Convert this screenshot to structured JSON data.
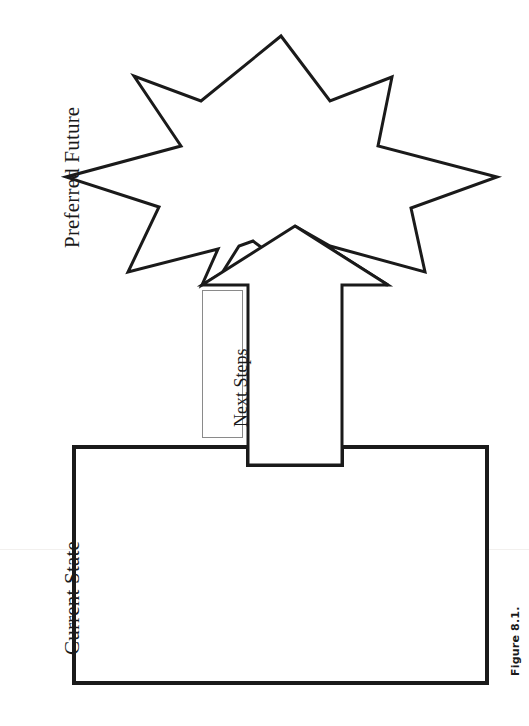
{
  "figure": {
    "caption": "Figure 8.1.",
    "stroke_color": "#1a1a1a",
    "fill_color": "#ffffff",
    "page_background": "#ffffff"
  },
  "labels": {
    "preferred_future": "Preferred Future",
    "current_state": "Current State",
    "next_steps": "Next Steps"
  },
  "shapes": {
    "starburst": {
      "name": "preferred-future-starburst",
      "points": 8,
      "stroke_width": 3,
      "outline_points": "281,36 330,101 392,77 378,146 497,177 411,208 425,272 330,246 295,226 388,285 293,271 253,241 239,246 222,273 202,285 218,249 128,272 159,207 66,177 181,146 134,76 201,101"
    },
    "arrow": {
      "name": "next-steps-arrow",
      "direction": "up",
      "stroke_width": 3,
      "outline_points": "295,226 388,285 342,285 342,465 248,465 248,285 202,285"
    },
    "current_state_rect": {
      "name": "current-state-rectangle",
      "stroke_width": 4,
      "x": 74,
      "y": 447,
      "width": 413,
      "height": 236,
      "notch_left": 248,
      "notch_right": 342
    },
    "next_steps_label_box": {
      "name": "next-steps-label-box",
      "x": 202,
      "y": 290,
      "width": 41,
      "height": 148,
      "stroke_color": "#8a8a8a"
    }
  }
}
